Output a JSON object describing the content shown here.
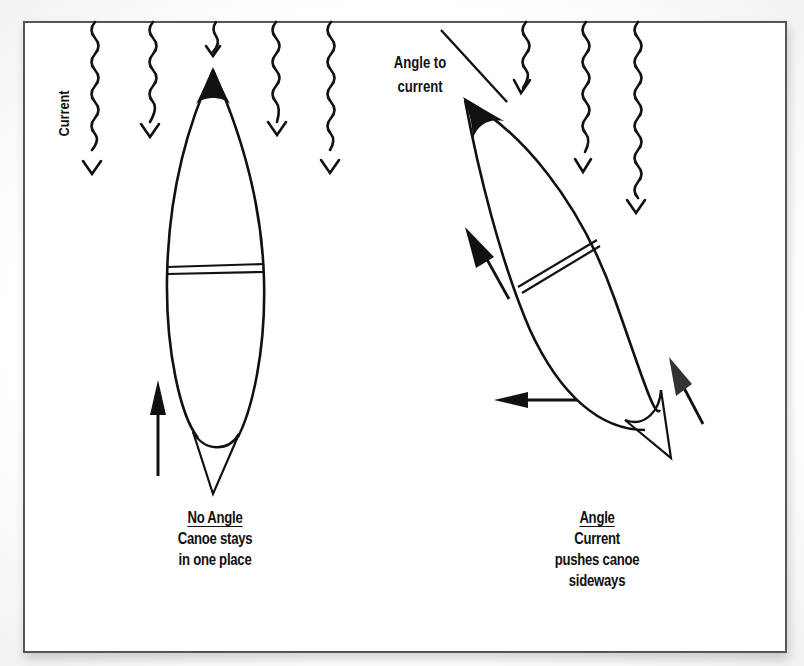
{
  "figure": {
    "frame_color": "#555555",
    "ink_color": "#111111",
    "background": "#ffffff"
  },
  "labels": {
    "current": "Current",
    "angle_to_current": [
      "Angle to",
      "current"
    ]
  },
  "left_panel": {
    "title": "No Angle",
    "caption_lines": [
      "Canoe stays",
      "in one place"
    ]
  },
  "right_panel": {
    "title": "Angle",
    "caption_lines": [
      "Current",
      "pushes canoe",
      "sideways"
    ]
  },
  "current_arrows": {
    "direction": "down",
    "left_group_x": [
      92,
      150,
      213,
      276,
      329
    ],
    "right_group_x": [
      523,
      583,
      636
    ]
  },
  "force_arrows": [
    {
      "panel": "left",
      "direction": "up"
    },
    {
      "panel": "right",
      "direction": "up-left"
    },
    {
      "panel": "right",
      "direction": "left"
    },
    {
      "panel": "right",
      "direction": "up-left"
    }
  ],
  "icons": {
    "current_arrow": "wavy-down-arrow-icon",
    "force_arrow": "straight-arrow-icon",
    "canoe": "canoe-outline-icon"
  }
}
